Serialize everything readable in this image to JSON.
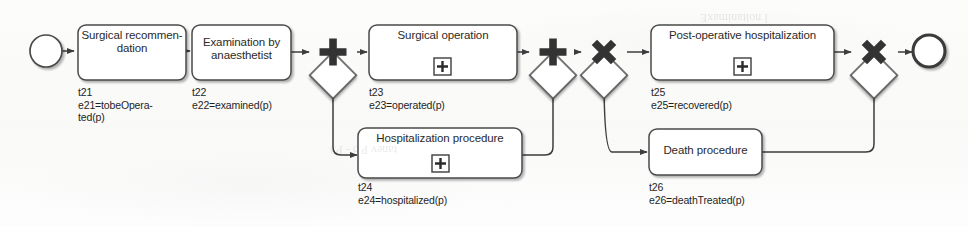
{
  "diagram": {
    "type": "bpmn-process-diagram",
    "colors": {
      "stroke": "#3d3d3d",
      "fill": "#ffffff",
      "background": "#fbfbfa",
      "text": "#2a2a2a"
    },
    "events": [
      {
        "id": "start",
        "kind": "start-event",
        "label": ""
      },
      {
        "id": "end",
        "kind": "end-event",
        "label": ""
      }
    ],
    "gateways": [
      {
        "id": "g1",
        "kind": "parallel-gateway",
        "symbol": "+",
        "role": "split"
      },
      {
        "id": "g2",
        "kind": "parallel-gateway",
        "symbol": "+",
        "role": "join"
      },
      {
        "id": "g3",
        "kind": "exclusive-gateway",
        "symbol": "x",
        "role": "split"
      },
      {
        "id": "g4",
        "kind": "exclusive-gateway",
        "symbol": "x",
        "role": "join"
      }
    ],
    "tasks": [
      {
        "id": "t21",
        "name": "Surgical recommen-\ndation",
        "transition": "t21",
        "event": "e21=tobeOpera-\nted(p)",
        "subprocess": false
      },
      {
        "id": "t22",
        "name": "Examination by\nanaesthetist",
        "transition": "t22",
        "event": "e22=examined(p)",
        "subprocess": false
      },
      {
        "id": "t23",
        "name": "Surgical operation",
        "transition": "t23",
        "event": "e23=operated(p)",
        "subprocess": true
      },
      {
        "id": "t24",
        "name": "Hospitalization procedure",
        "transition": "t24",
        "event": "e24=hospitalized(p)",
        "subprocess": true
      },
      {
        "id": "t25",
        "name": "Post-operative hospitalization",
        "transition": "t25",
        "event": "e25=recovered(p)",
        "subprocess": true
      },
      {
        "id": "t26",
        "name": "Death procedure",
        "transition": "t26",
        "event": "e26=deathTreated(p)",
        "subprocess": false
      }
    ],
    "subprocess_marker": "+"
  }
}
